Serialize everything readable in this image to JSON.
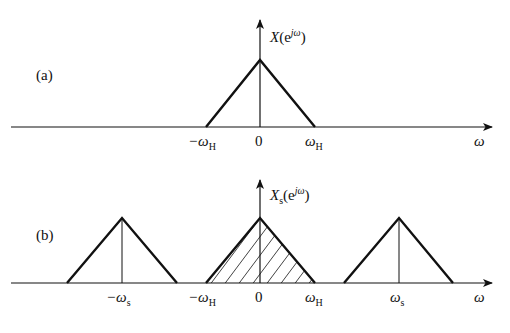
{
  "figure": {
    "panels": [
      {
        "id": "a",
        "panel_label": "(a)",
        "y_axis_label": {
          "main": "X",
          "open": "(e",
          "sup": "jω",
          "close": ")"
        },
        "x_axis_label": "ω",
        "ticks": [
          {
            "text": "−ω",
            "sub": "H"
          },
          {
            "text": "0",
            "sub": ""
          },
          {
            "text": "ω",
            "sub": "H"
          }
        ],
        "triangles": [
          {
            "center": "0",
            "half_width": "ω_H",
            "hatched": false
          }
        ]
      },
      {
        "id": "b",
        "panel_label": "(b)",
        "y_axis_label": {
          "main": "X",
          "sub": "s",
          "open": "(e",
          "sup": "jω",
          "close": ")"
        },
        "x_axis_label": "ω",
        "ticks": [
          {
            "text": "−ω",
            "sub": "s"
          },
          {
            "text": "−ω",
            "sub": "H"
          },
          {
            "text": "0",
            "sub": ""
          },
          {
            "text": "ω",
            "sub": "H"
          },
          {
            "text": "ω",
            "sub": "s"
          }
        ],
        "triangles": [
          {
            "center": "−ω_s",
            "half_width": "ω_H",
            "hatched": false
          },
          {
            "center": "0",
            "half_width": "ω_H",
            "hatched": true
          },
          {
            "center": "ω_s",
            "half_width": "ω_H",
            "hatched": false
          }
        ]
      }
    ],
    "colors": {
      "line": "#111111",
      "background": "#ffffff"
    }
  }
}
